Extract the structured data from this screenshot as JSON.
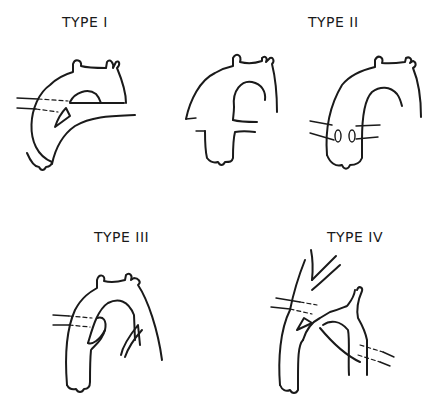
{
  "diagram": {
    "panels": [
      {
        "id": "type-1",
        "label": "TYPE I"
      },
      {
        "id": "type-2",
        "label": "TYPE II"
      },
      {
        "id": "type-3",
        "label": "TYPE III"
      },
      {
        "id": "type-4",
        "label": "TYPE IV"
      }
    ],
    "colors": {
      "ink": "#1a1a1a",
      "background": "#ffffff"
    }
  }
}
